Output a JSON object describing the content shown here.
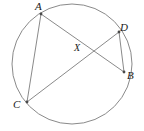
{
  "figure": {
    "kind": "geometry-diagram",
    "canvas": {
      "width": 144,
      "height": 131,
      "background": "#ffffff"
    },
    "stroke": {
      "color": "#8a8a8a",
      "width": 1
    },
    "label_color": "#1a1a1a",
    "circle": {
      "cx": 72,
      "cy": 64,
      "r": 60
    },
    "points": [
      {
        "id": "A",
        "label": "A",
        "x": 41,
        "y": 14
      },
      {
        "id": "B",
        "label": "B",
        "x": 124,
        "y": 72
      },
      {
        "id": "C",
        "label": "C",
        "x": 27,
        "y": 102
      },
      {
        "id": "D",
        "label": "D",
        "x": 119,
        "y": 32
      },
      {
        "id": "X",
        "label": "X",
        "x": 85,
        "y": 53
      }
    ],
    "segments": [
      {
        "id": "AB",
        "from": "A",
        "to": "B"
      },
      {
        "id": "CD",
        "from": "C",
        "to": "D"
      },
      {
        "id": "AC",
        "from": "A",
        "to": "C"
      },
      {
        "id": "DB",
        "from": "D",
        "to": "B"
      }
    ]
  }
}
